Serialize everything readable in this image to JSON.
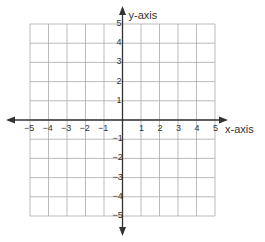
{
  "chart_data": {
    "type": "scatter",
    "title": "",
    "xlabel": "x-axis",
    "ylabel": "y-axis",
    "xlim": [
      -5,
      5
    ],
    "ylim": [
      -5,
      5
    ],
    "grid": true,
    "x_ticks": [
      -5,
      -4,
      -3,
      -2,
      -1,
      1,
      2,
      3,
      4,
      5
    ],
    "y_ticks": [
      5,
      4,
      3,
      2,
      1,
      -1,
      -2,
      -3,
      -4,
      -5
    ],
    "x_tick_labels": [
      "−5",
      "−4",
      "−3",
      "−2",
      "−1",
      "1",
      "2",
      "3",
      "4",
      "5"
    ],
    "y_tick_labels": [
      "5",
      "4",
      "3",
      "2",
      "1",
      "−1",
      "−2",
      "−3",
      "−4",
      "−5"
    ],
    "points": [],
    "axes_arrows": true
  },
  "colors": {
    "grid": "#aaaaaa",
    "axis": "#333333",
    "text": "#333333"
  },
  "layout": {
    "grid_left": 30,
    "grid_right": 215,
    "grid_top": 24,
    "grid_bottom": 216,
    "origin_x": 123,
    "origin_y": 120
  }
}
